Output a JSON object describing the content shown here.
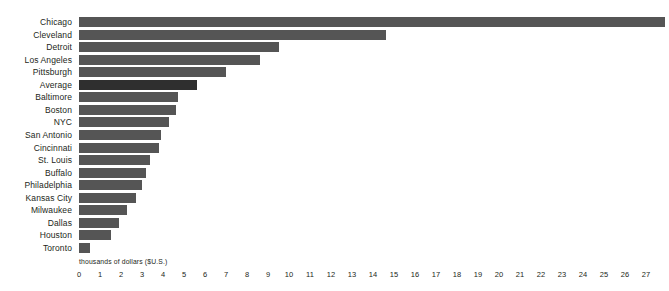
{
  "chart_data": {
    "type": "bar",
    "orientation": "horizontal",
    "title": "",
    "xlabel": "thousands of dollars ($U.S.)",
    "ylabel": "",
    "xlim": [
      0,
      27
    ],
    "xticks": [
      0,
      1,
      2,
      3,
      4,
      5,
      6,
      7,
      8,
      9,
      10,
      11,
      12,
      13,
      14,
      15,
      16,
      17,
      18,
      19,
      20,
      21,
      22,
      23,
      24,
      25,
      26,
      27
    ],
    "grid": false,
    "legend": null,
    "categories": [
      "Chicago",
      "Cleveland",
      "Detroit",
      "Los Angeles",
      "Pittsburgh",
      "Average",
      "Baltimore",
      "Boston",
      "NYC",
      "San Antonio",
      "Cincinnati",
      "St. Louis",
      "Buffalo",
      "Philadelphia",
      "Kansas City",
      "Milwaukee",
      "Dallas",
      "Houston",
      "Toronto"
    ],
    "values": [
      27.9,
      14.6,
      9.5,
      8.6,
      7.0,
      5.6,
      4.7,
      4.6,
      4.3,
      3.9,
      3.8,
      3.4,
      3.2,
      3.0,
      2.7,
      2.3,
      1.9,
      1.5,
      0.5
    ],
    "highlight_category": "Average",
    "colors": {
      "bar": "#555555",
      "highlight_bar": "#2f2f2f",
      "background": "#ffffff",
      "text": "#231f20"
    }
  }
}
